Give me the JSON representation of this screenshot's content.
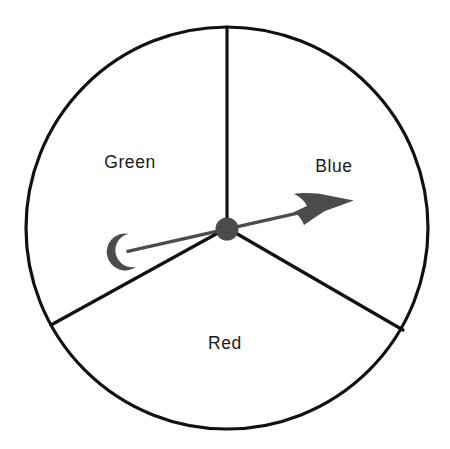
{
  "figure": {
    "type": "spinner-wheel",
    "background_color": "#ffffff"
  },
  "wheel": {
    "center": {
      "x": 227,
      "y": 228
    },
    "radius": 201,
    "outline_color": "#111111",
    "outline_width": 3.2,
    "fill_color": "#ffffff",
    "divider_color": "#111111",
    "divider_width": 3.2,
    "sectors": [
      {
        "name": "green-sector",
        "label": "Green",
        "start_angle_deg": 90,
        "end_angle_deg": 209,
        "sweep_deg": 119,
        "label_x": 130,
        "label_y": 163
      },
      {
        "name": "blue-sector",
        "label": "Blue",
        "start_angle_deg": 331,
        "end_angle_deg": 90,
        "sweep_deg": 119,
        "label_x": 334,
        "label_y": 167
      },
      {
        "name": "red-sector",
        "label": "Red",
        "start_angle_deg": 209,
        "end_angle_deg": 331,
        "sweep_deg": 122,
        "label_x": 225,
        "label_y": 344
      }
    ],
    "divider_endpoints": [
      {
        "name": "divider-top",
        "x": 227,
        "y": 27
      },
      {
        "name": "divider-lower-left",
        "x": 51,
        "y": 325
      },
      {
        "name": "divider-lower-right",
        "x": 403,
        "y": 330
      }
    ]
  },
  "pointer": {
    "name": "spinner-needle",
    "color": "#4c4c4c",
    "angle_deg": 13,
    "shaft_width": 3.4,
    "tip": {
      "x": 356,
      "y": 201
    },
    "tail": {
      "x": 115,
      "y": 248
    },
    "hub": {
      "name": "spinner-hub",
      "x": 227,
      "y": 229,
      "radius": 11.5,
      "color": "#4c4c4c"
    },
    "points_to_sector": "Blue"
  },
  "labels": {
    "green": "Green",
    "blue": "Blue",
    "red": "Red"
  }
}
